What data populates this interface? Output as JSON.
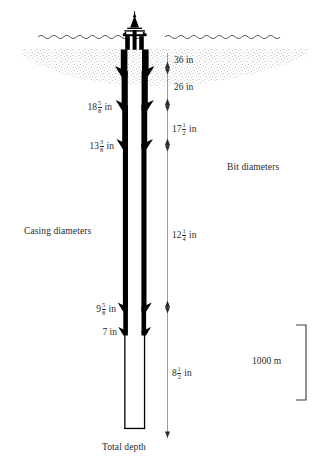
{
  "diagram": {
    "title_labels": {
      "casing_diameters": "Casing diameters",
      "bit_diameters": "Bit diameters",
      "total_depth": "Total depth",
      "scale": "1000 m"
    },
    "casing_diameters": [
      {
        "id": "casing-18-5-8",
        "whole": "18",
        "num": "5",
        "den": "8",
        "unit": "in",
        "text": "18 5/8 in"
      },
      {
        "id": "casing-13-3-8",
        "whole": "13",
        "num": "3",
        "den": "8",
        "unit": "in",
        "text": "13 3/8 in"
      },
      {
        "id": "casing-9-5-8",
        "whole": "9",
        "num": "5",
        "den": "8",
        "unit": "in",
        "text": "9 5/8 in"
      },
      {
        "id": "casing-7",
        "whole": "7",
        "num": "",
        "den": "",
        "unit": "in",
        "text": "7 in"
      }
    ],
    "bit_diameters": [
      {
        "id": "bit-36",
        "whole": "36",
        "num": "",
        "den": "",
        "unit": "in",
        "text": "36 in"
      },
      {
        "id": "bit-26",
        "whole": "26",
        "num": "",
        "den": "",
        "unit": "in",
        "text": "26 in"
      },
      {
        "id": "bit-17-1-2",
        "whole": "17",
        "num": "1",
        "den": "2",
        "unit": "in",
        "text": "17 1/2 in"
      },
      {
        "id": "bit-12-1-4",
        "whole": "12",
        "num": "1",
        "den": "4",
        "unit": "in",
        "text": "12 1/4 in"
      },
      {
        "id": "bit-8-1-2",
        "whole": "8",
        "num": "1",
        "den": "2",
        "unit": "in",
        "text": "8 1/2 in"
      }
    ],
    "colors": {
      "ink": "#1a1a1a",
      "casing": "#000000",
      "scale_line": "#6b6b6b",
      "seabed_stipple": "#6e6e6e",
      "background": "#ffffff"
    }
  }
}
